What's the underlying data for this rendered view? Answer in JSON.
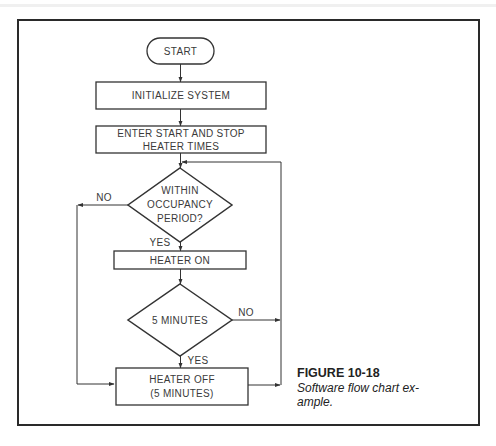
{
  "diagram": {
    "type": "flowchart",
    "nodes": {
      "start": {
        "shape": "terminal",
        "label": "START"
      },
      "initialize": {
        "shape": "process",
        "label": "INITIALIZE SYSTEM"
      },
      "enter_times": {
        "shape": "process",
        "line1": "ENTER START AND STOP",
        "line2": "HEATER TIMES"
      },
      "occupancy": {
        "shape": "decision",
        "line1": "WITHIN",
        "line2": "OCCUPANCY",
        "line3": "PERIOD?"
      },
      "heater_on": {
        "shape": "process",
        "label": "HEATER ON"
      },
      "five_min": {
        "shape": "decision",
        "label": "5 MINUTES"
      },
      "heater_off": {
        "shape": "process",
        "line1": "HEATER OFF",
        "line2": "(5 MINUTES)"
      }
    },
    "edges": {
      "occupancy_no": "NO",
      "occupancy_yes": "YES",
      "five_min_no": "NO",
      "five_min_yes": "YES"
    }
  },
  "caption": {
    "title": "FIGURE 10-18",
    "text_line1": "Software flow chart ex-",
    "text_line2": "ample."
  }
}
